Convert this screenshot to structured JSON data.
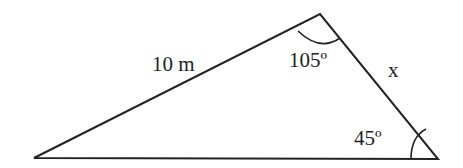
{
  "diagram": {
    "type": "triangle",
    "vertices": {
      "left": [
        34,
        158
      ],
      "top": [
        320,
        14
      ],
      "right": [
        438,
        159
      ]
    },
    "side_labels": {
      "left_side": "10 m",
      "right_side": "x"
    },
    "angle_labels": {
      "top": "105º",
      "right": "45º"
    },
    "colors": {
      "stroke": "#222222",
      "background": "#ffffff"
    }
  }
}
